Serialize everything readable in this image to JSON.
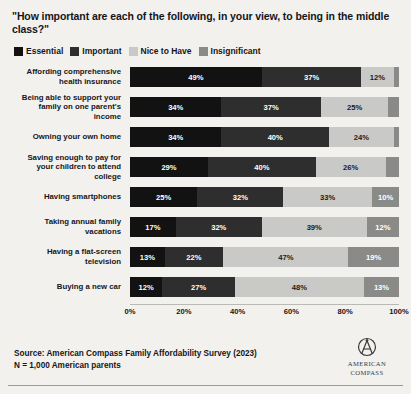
{
  "title": "\"How important are each of the following, in your view, to being in the middle class?\"",
  "legend": {
    "items": [
      {
        "label": "Essential",
        "color": "#121212"
      },
      {
        "label": "Important",
        "color": "#2e2e2e"
      },
      {
        "label": "Nice to Have",
        "color": "#c9c9c7"
      },
      {
        "label": "Insignificant",
        "color": "#8a8a88"
      }
    ]
  },
  "footer": {
    "source_line": "Source: American Compass Family Affordability Survey (2023)",
    "sample_line": "N = 1,000 American parents"
  },
  "logo": {
    "line1": "AMERICAN",
    "line2": "COMPASS"
  },
  "chart_data": {
    "type": "bar",
    "orientation": "horizontal",
    "stacked": true,
    "title": "\"How important are each of the following, in your view, to being in the middle class?\"",
    "xlabel": "",
    "ylabel": "",
    "xlim": [
      0,
      100
    ],
    "grid": false,
    "legend_position": "top",
    "tick_labels": [
      "0%",
      "20%",
      "40%",
      "60%",
      "80%",
      "100%"
    ],
    "tick_values": [
      0,
      20,
      40,
      60,
      80,
      100
    ],
    "categories": [
      "Affording comprehensive health insurance",
      "Being able to support your family on one parent's income",
      "Owning your own home",
      "Saving enough to pay for your children to attend college",
      "Having smartphones",
      "Taking annual family vacations",
      "Having a flat-screen television",
      "Buying a new car"
    ],
    "series": [
      {
        "name": "Essential",
        "color": "#121212",
        "values": [
          49,
          34,
          34,
          29,
          25,
          17,
          13,
          12
        ]
      },
      {
        "name": "Important",
        "color": "#2e2e2e",
        "values": [
          37,
          37,
          40,
          40,
          32,
          32,
          22,
          27
        ]
      },
      {
        "name": "Nice to Have",
        "color": "#c9c9c7",
        "values": [
          12,
          25,
          24,
          26,
          33,
          39,
          47,
          48
        ]
      },
      {
        "name": "Insignificant",
        "color": "#8a8a88",
        "values": [
          2,
          4,
          2,
          5,
          10,
          12,
          19,
          13
        ]
      }
    ],
    "data_labels": [
      [
        "49%",
        "37%",
        "12%",
        ""
      ],
      [
        "34%",
        "37%",
        "25%",
        ""
      ],
      [
        "34%",
        "40%",
        "24%",
        ""
      ],
      [
        "29%",
        "40%",
        "26%",
        ""
      ],
      [
        "25%",
        "32%",
        "33%",
        "10%"
      ],
      [
        "17%",
        "32%",
        "39%",
        "12%"
      ],
      [
        "13%",
        "22%",
        "47%",
        "19%"
      ],
      [
        "12%",
        "27%",
        "48%",
        "13%"
      ]
    ]
  }
}
